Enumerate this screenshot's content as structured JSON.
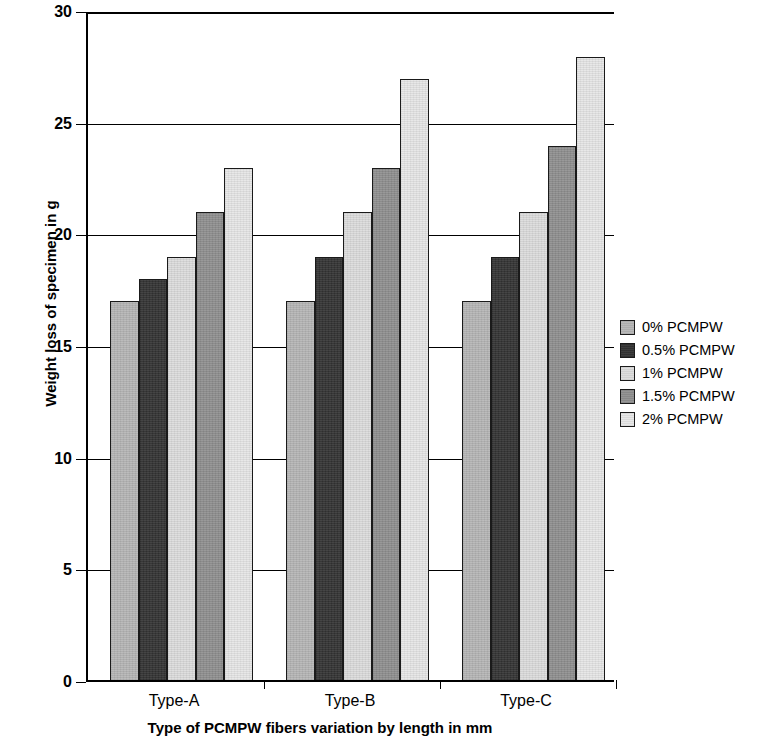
{
  "chart_data": {
    "type": "bar",
    "title": "",
    "xlabel": "Type of PCMPW fibers variation by length in mm",
    "ylabel": "Weight loss of specimen in g",
    "categories": [
      "Type-A",
      "Type-B",
      "Type-C"
    ],
    "ylim": [
      0,
      30
    ],
    "ytick_step": 5,
    "yticks": [
      "0",
      "5",
      "10",
      "15",
      "20",
      "25",
      "30"
    ],
    "grid": "horizontal",
    "legend_position": "right",
    "series": [
      {
        "name": "0% PCMPW",
        "color": "#b5b5b5",
        "values": [
          17,
          17,
          17
        ]
      },
      {
        "name": "0.5% PCMPW",
        "color": "#333333",
        "values": [
          18,
          19,
          19
        ]
      },
      {
        "name": "1% PCMPW",
        "color": "#dcdcdc",
        "values": [
          19,
          21,
          21
        ]
      },
      {
        "name": "1.5% PCMPW",
        "color": "#8f8f8f",
        "values": [
          21,
          23,
          24
        ]
      },
      {
        "name": "2% PCMPW",
        "color": "#e6e6e6",
        "values": [
          23,
          27,
          28
        ]
      }
    ]
  }
}
